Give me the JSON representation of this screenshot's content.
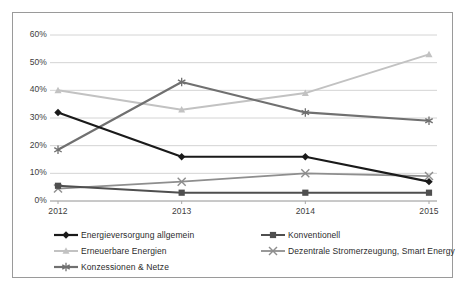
{
  "chart_data": {
    "type": "line",
    "title": "",
    "subtitle": "",
    "xlabel": "",
    "ylabel": "",
    "categories": [
      "2012",
      "2013",
      "2014",
      "2015"
    ],
    "x": [
      2012,
      2013,
      2014,
      2015
    ],
    "ylim": [
      0,
      60
    ],
    "ytick_labels": [
      "0%",
      "10%",
      "20%",
      "30%",
      "40%",
      "50%",
      "60%"
    ],
    "ytick_values": [
      0,
      10,
      20,
      30,
      40,
      50,
      60
    ],
    "grid": "horizontal",
    "legend_position": "bottom",
    "value_suffix": "%",
    "series": [
      {
        "name": "Energieversorgung allgemein",
        "values": [
          32,
          16,
          16,
          7
        ],
        "color": "#1a1a1a",
        "marker": "diamond",
        "width": 2.2
      },
      {
        "name": "Konventionell",
        "values": [
          5.5,
          3,
          3,
          3
        ],
        "color": "#4f4f4f",
        "marker": "square",
        "width": 2.0
      },
      {
        "name": "Erneuerbare Energien",
        "values": [
          40,
          33,
          39,
          53
        ],
        "color": "#c2c2c2",
        "marker": "triangle",
        "width": 2.0
      },
      {
        "name": "Dezentrale Stromerzeugung, Smart Energy",
        "values": [
          4.5,
          7,
          10,
          9
        ],
        "color": "#8e8e8e",
        "marker": "cross",
        "width": 1.8
      },
      {
        "name": "Konzessionen & Netze",
        "values": [
          18.5,
          43,
          32,
          29
        ],
        "color": "#707070",
        "marker": "asterisk",
        "width": 2.2
      }
    ]
  },
  "legend": {
    "items": [
      {
        "label": "Energieversorgung allgemein",
        "series_index": 0
      },
      {
        "label": "Konventionell",
        "series_index": 1
      },
      {
        "label": "Erneuerbare Energien",
        "series_index": 2
      },
      {
        "label": "Dezentrale Stromerzeugung, Smart Energy",
        "series_index": 3
      },
      {
        "label": "Konzessionen & Netze",
        "series_index": 4
      }
    ]
  },
  "axis": {
    "y_labels": [
      "60%",
      "50%",
      "40%",
      "30%",
      "20%",
      "10%",
      "0%"
    ],
    "x_labels": [
      "2012",
      "2013",
      "2014",
      "2015"
    ]
  }
}
